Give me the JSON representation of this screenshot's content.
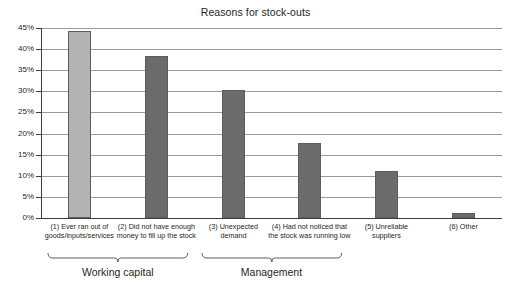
{
  "chart_data": {
    "type": "bar",
    "title": "Reasons for stock-outs",
    "xlabel": "",
    "ylabel": "",
    "ylim": [
      0,
      45
    ],
    "ytick_labels": [
      "45%",
      "40%",
      "35%",
      "30%",
      "25%",
      "20%",
      "15%",
      "10%",
      "5%",
      "0%"
    ],
    "ytick_values": [
      45,
      40,
      35,
      30,
      25,
      20,
      15,
      10,
      5,
      0
    ],
    "grid": true,
    "legend": "none",
    "categories": [
      "(1) Ever ran out of goods/inputs/services",
      "(2) Did not have enough money to fill up the stock",
      "(3) Unexpected demand",
      "(4) Had not noticed that the stock was running low",
      "(5) Unreliable suppliers",
      "(6) Other"
    ],
    "category_lines": [
      [
        "(1) Ever ran out of",
        "goods/inputs/services"
      ],
      [
        "(2) Did not have enough",
        "money to fill up the stock"
      ],
      [
        "(3) Unexpected",
        "demand"
      ],
      [
        "(4) Had not noticed that",
        "the stock was running low"
      ],
      [
        "(5) Unreliable",
        "suppliers"
      ],
      [
        "(6) Other"
      ]
    ],
    "values": [
      44.4,
      38.4,
      30.3,
      17.8,
      11.1,
      1.3
    ],
    "bar_colors": [
      "#b3b3b3",
      "#6b6b6b",
      "#6b6b6b",
      "#6b6b6b",
      "#6b6b6b",
      "#6b6b6b"
    ],
    "bar_border_color": "#5c5c5c",
    "groups": [
      {
        "label": "Working capital",
        "categories": [
          0,
          1
        ]
      },
      {
        "label": "Management",
        "categories": [
          2,
          3
        ]
      }
    ]
  },
  "colors": {
    "background": "#ffffff",
    "text": "#231f20",
    "gridline": "#9b9b9b",
    "axis": "#3d3d3d",
    "bar_light": "#b3b3b3",
    "bar_dark": "#6b6b6b"
  }
}
